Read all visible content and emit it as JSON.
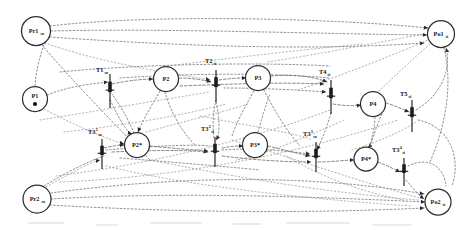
{
  "diagram": {
    "kind": "petri-net",
    "background": "#ffffff",
    "stroke_color": "#2e2e2e",
    "arc_color": "#6f6f6f",
    "width": 473,
    "height": 230,
    "places": [
      {
        "id": "pr1",
        "name": "Pr1",
        "subscript": "so",
        "cx": 36,
        "cy": 31,
        "r": 14.5,
        "tokens": 0
      },
      {
        "id": "p1",
        "name": "P1",
        "subscript": "",
        "cx": 35,
        "cy": 99,
        "r": 12.5,
        "tokens": 1
      },
      {
        "id": "p2",
        "name": "P2",
        "subscript": "",
        "cx": 166,
        "cy": 79,
        "r": 12.5,
        "tokens": 0
      },
      {
        "id": "p3",
        "name": "P3",
        "subscript": "",
        "cx": 258,
        "cy": 78,
        "r": 12.5,
        "tokens": 0
      },
      {
        "id": "p4",
        "name": "P4",
        "subscript": "",
        "cx": 373,
        "cy": 104,
        "r": 12.5,
        "tokens": 0
      },
      {
        "id": "p2s",
        "name": "P2*",
        "subscript": "",
        "cx": 137,
        "cy": 145,
        "r": 12.5,
        "tokens": 0
      },
      {
        "id": "p3s",
        "name": "P3*",
        "subscript": "",
        "cx": 255,
        "cy": 145,
        "r": 12.5,
        "tokens": 0
      },
      {
        "id": "p4s",
        "name": "P4*",
        "subscript": "",
        "cx": 366,
        "cy": 159,
        "r": 12.0,
        "tokens": 0
      },
      {
        "id": "po1",
        "name": "Po1",
        "subscript": "si",
        "cx": 441,
        "cy": 34,
        "r": 13.5,
        "tokens": 0
      },
      {
        "id": "pr2",
        "name": "Pr2",
        "subscript": "so",
        "cx": 37,
        "cy": 199,
        "r": 14.0,
        "tokens": 0
      },
      {
        "id": "po2",
        "name": "Po2",
        "subscript": "si",
        "cx": 438,
        "cy": 202,
        "r": 13.0,
        "tokens": 0
      }
    ],
    "transitions": [
      {
        "id": "t1",
        "label": "T1",
        "superscript": "",
        "subscript": "so",
        "x": 110,
        "y": 91,
        "half": 17,
        "lx": 96,
        "ly": 72
      },
      {
        "id": "t2",
        "label": "T2",
        "superscript": "",
        "subscript": "si",
        "x": 216,
        "y": 86,
        "half": 16,
        "lx": 205,
        "ly": 63
      },
      {
        "id": "t4",
        "label": "T4",
        "superscript": "",
        "subscript": "si",
        "x": 331,
        "y": 97,
        "half": 17,
        "lx": 319,
        "ly": 74
      },
      {
        "id": "t5",
        "label": "T5",
        "superscript": "",
        "subscript": "si",
        "x": 412,
        "y": 116,
        "half": 16,
        "lx": 400,
        "ly": 96
      },
      {
        "id": "t31",
        "label": "T3",
        "superscript": "1",
        "subscript": "so",
        "x": 102,
        "y": 154,
        "half": 15,
        "lx": 88,
        "ly": 134
      },
      {
        "id": "t32",
        "label": "T3",
        "superscript": "2",
        "subscript": "si",
        "x": 215,
        "y": 152,
        "half": 15,
        "lx": 201,
        "ly": 131
      },
      {
        "id": "t33",
        "label": "T3",
        "superscript": "3",
        "subscript": "so",
        "x": 316,
        "y": 157,
        "half": 15,
        "lx": 303,
        "ly": 136
      },
      {
        "id": "t34",
        "label": "T3",
        "superscript": "4",
        "subscript": "si",
        "x": 404,
        "y": 172,
        "half": 14,
        "lx": 392,
        "ly": 152
      }
    ]
  }
}
